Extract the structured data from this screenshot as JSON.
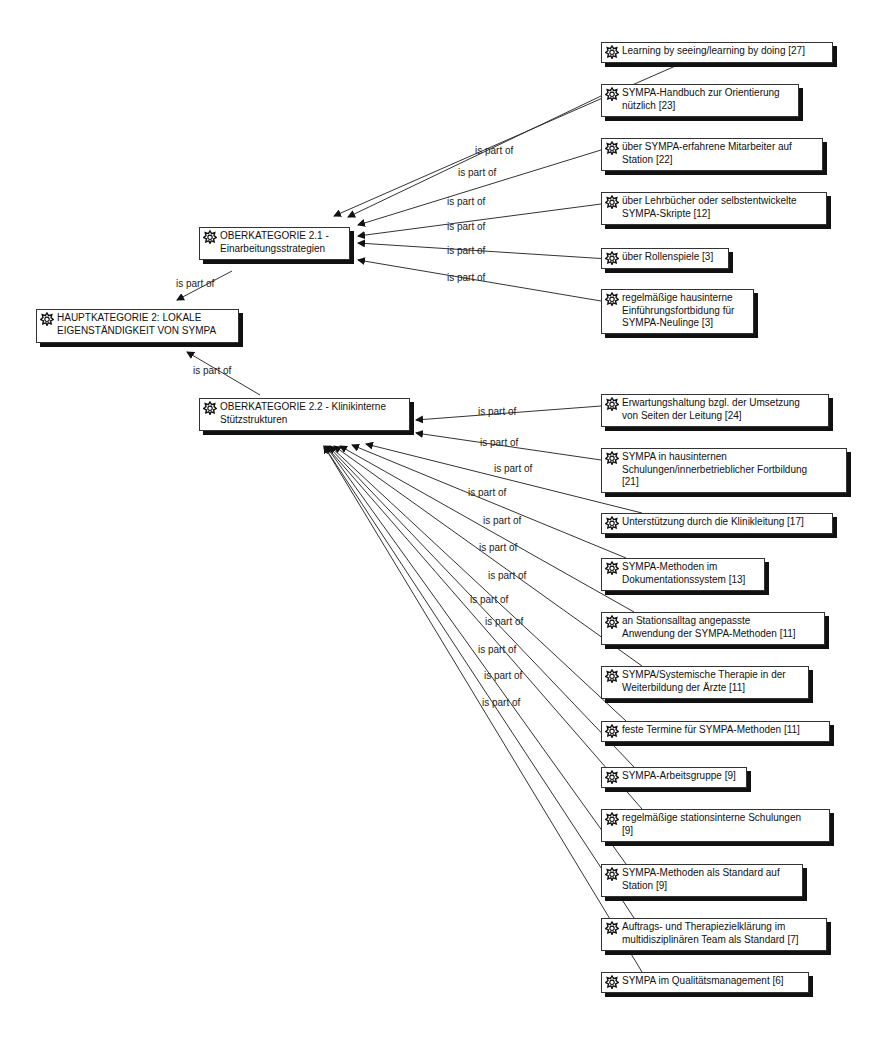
{
  "diagram": {
    "edge_label": "is part of",
    "nodes": [
      {
        "id": "hk2",
        "text": "HAUPTKATEGORIE 2: LOKALE\nEIGENSTÄNDIGKEIT VON SYMPA",
        "x": 36,
        "y": 309,
        "w": 203,
        "h": 34
      },
      {
        "id": "ok21",
        "text": "OBERKATEGORIE 2.1 -\nEinarbeitungsstrategien",
        "x": 199,
        "y": 227,
        "w": 151,
        "h": 33
      },
      {
        "id": "ok22",
        "text": "OBERKATEGORIE 2.2 - Klinikinterne\nStützstrukturen",
        "x": 199,
        "y": 398,
        "w": 211,
        "h": 33
      },
      {
        "id": "a1",
        "text": "Learning by seeing/learning by doing [27]",
        "x": 601,
        "y": 42,
        "w": 232,
        "h": 21
      },
      {
        "id": "a2",
        "text": "SYMPA-Handbuch zur Orientierung\nnützlich [23]",
        "x": 601,
        "y": 84,
        "w": 198,
        "h": 33
      },
      {
        "id": "a3",
        "text": "über SYMPA-erfahrene Mitarbeiter auf\nStation [22]",
        "x": 601,
        "y": 138,
        "w": 222,
        "h": 33
      },
      {
        "id": "a4",
        "text": "über Lehrbücher oder selbstentwickelte\nSYMPA-Skripte [12]",
        "x": 601,
        "y": 192,
        "w": 226,
        "h": 33
      },
      {
        "id": "a5",
        "text": "über Rollenspiele [3]",
        "x": 601,
        "y": 248,
        "w": 128,
        "h": 21
      },
      {
        "id": "a6",
        "text": "regelmäßige hausinterne\nEinführungsfortbidung für\nSYMPA-Neulinge [3]",
        "x": 601,
        "y": 289,
        "w": 153,
        "h": 45
      },
      {
        "id": "b1",
        "text": "Erwartungshaltung bzgl. der Umsetzung\nvon Seiten der Leitung [24]",
        "x": 601,
        "y": 394,
        "w": 228,
        "h": 33
      },
      {
        "id": "b2",
        "text": "SYMPA in hausinternen\nSchulungen/innerbetrieblicher Fortbildung\n[21]",
        "x": 601,
        "y": 448,
        "w": 246,
        "h": 45
      },
      {
        "id": "b3",
        "text": "Unterstützung durch die Klinikleitung [17]",
        "x": 601,
        "y": 513,
        "w": 232,
        "h": 21
      },
      {
        "id": "b4",
        "text": "SYMPA-Methoden im\nDokumentationssystem [13]",
        "x": 601,
        "y": 558,
        "w": 164,
        "h": 33
      },
      {
        "id": "b5",
        "text": "an Stationsalltag angepasste\nAnwendung der SYMPA-Methoden [11]",
        "x": 601,
        "y": 612,
        "w": 224,
        "h": 33
      },
      {
        "id": "b6",
        "text": "SYMPA/Systemische Therapie in der\nWeiterbildung der Ärzte [11]",
        "x": 601,
        "y": 666,
        "w": 208,
        "h": 33
      },
      {
        "id": "b7",
        "text": "feste Termine für SYMPA-Methoden [11]",
        "x": 601,
        "y": 721,
        "w": 229,
        "h": 21
      },
      {
        "id": "b8",
        "text": "SYMPA-Arbeitsgruppe [9]",
        "x": 601,
        "y": 767,
        "w": 146,
        "h": 21
      },
      {
        "id": "b9",
        "text": "regelmäßige stationsinterne Schulungen\n[9]",
        "x": 601,
        "y": 809,
        "w": 229,
        "h": 33
      },
      {
        "id": "b10",
        "text": "SYMPA-Methoden als Standard auf\nStation [9]",
        "x": 601,
        "y": 864,
        "w": 202,
        "h": 33
      },
      {
        "id": "b11",
        "text": "Auftrags- und Therapiezielklärung im\nmultidisziplinären Team als Standard [7]",
        "x": 601,
        "y": 918,
        "w": 226,
        "h": 33
      },
      {
        "id": "b12",
        "text": "SYMPA im Qualitätsmanagement [6]",
        "x": 601,
        "y": 972,
        "w": 208,
        "h": 21
      }
    ],
    "edges": [
      {
        "from": "ok21",
        "to": "hk2",
        "label": "is part of",
        "lx": 176,
        "ly": 278
      },
      {
        "from": "ok22",
        "to": "hk2",
        "label": "is part of",
        "lx": 193,
        "ly": 365
      },
      {
        "from": "a1",
        "to": "ok21",
        "label": "is part of",
        "lx": 475,
        "ly": 145
      },
      {
        "from": "a2",
        "to": "ok21",
        "label": "is part of",
        "lx": 458,
        "ly": 167
      },
      {
        "from": "a3",
        "to": "ok21",
        "label": "is part of",
        "lx": 447,
        "ly": 196
      },
      {
        "from": "a4",
        "to": "ok21",
        "label": "is part of",
        "lx": 447,
        "ly": 221
      },
      {
        "from": "a5",
        "to": "ok21",
        "label": "is part of",
        "lx": 447,
        "ly": 245
      },
      {
        "from": "a6",
        "to": "ok21",
        "label": "is part of",
        "lx": 447,
        "ly": 272
      },
      {
        "from": "b1",
        "to": "ok22",
        "label": "is part of",
        "lx": 478,
        "ly": 406
      },
      {
        "from": "b2",
        "to": "ok22",
        "label": "is part of",
        "lx": 480,
        "ly": 437
      },
      {
        "from": "b3",
        "to": "ok22",
        "label": "is part of",
        "lx": 494,
        "ly": 463
      },
      {
        "from": "b4",
        "to": "ok22",
        "label": "is part of",
        "lx": 468,
        "ly": 487
      },
      {
        "from": "b5",
        "to": "ok22",
        "label": "is part of",
        "lx": 483,
        "ly": 515
      },
      {
        "from": "b6",
        "to": "ok22",
        "label": "is part of",
        "lx": 479,
        "ly": 542
      },
      {
        "from": "b7",
        "to": "ok22",
        "label": "is part of",
        "lx": 488,
        "ly": 570
      },
      {
        "from": "b8",
        "to": "ok22",
        "label": "is part of",
        "lx": 470,
        "ly": 594
      },
      {
        "from": "b9",
        "to": "ok22",
        "label": "is part of",
        "lx": 485,
        "ly": 616
      },
      {
        "from": "b10",
        "to": "ok22",
        "label": "is part of",
        "lx": 478,
        "ly": 644
      },
      {
        "from": "b11",
        "to": "ok22",
        "label": "is part of",
        "lx": 484,
        "ly": 670
      },
      {
        "from": "b12",
        "to": "ok22",
        "label": "is part of",
        "lx": 482,
        "ly": 697
      }
    ],
    "icon": "code-family-icon",
    "colors": {
      "border": "#333333",
      "shadow": "#111111",
      "line": "#333333",
      "background": "#ffffff"
    }
  }
}
